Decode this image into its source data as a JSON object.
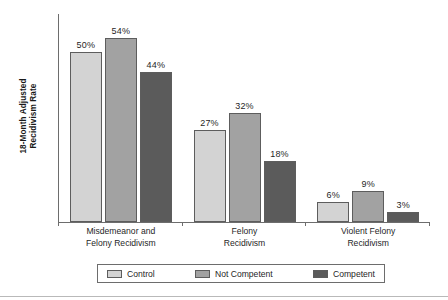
{
  "chart_data": {
    "type": "bar",
    "title": "",
    "subtitle": "",
    "xlabel": "",
    "ylabel": "18-Month Adjusted Recidivism Rate",
    "ylabel_lines": [
      "18-Month Adjusted",
      "Recidivism Rate"
    ],
    "ylim": [
      0,
      61
    ],
    "grid": false,
    "legend_position": "bottom",
    "value_suffix": "%",
    "categories": [
      "Misdemeanor and Felony Recidivism",
      "Felony Recidivism",
      "Violent Felony Recidivism"
    ],
    "category_lines": [
      [
        "Misdemeanor and",
        "Felony Recidivism"
      ],
      [
        "Felony",
        "Recidivism"
      ],
      [
        "Violent Felony",
        "Recidivism"
      ]
    ],
    "series": [
      {
        "name": "Control",
        "color": "#d3d3d3",
        "values": [
          50,
          27,
          6
        ],
        "labels": [
          "50%",
          "27%",
          "6%"
        ]
      },
      {
        "name": "Not Competent",
        "color": "#a2a2a2",
        "values": [
          54,
          32,
          9
        ],
        "labels": [
          "54%",
          "32%",
          "9%"
        ]
      },
      {
        "name": "Competent",
        "color": "#5b5b5b",
        "values": [
          44,
          18,
          3
        ],
        "labels": [
          "44%",
          "18%",
          "3%"
        ]
      }
    ]
  },
  "colors": {
    "control": "#d3d3d3",
    "not_competent": "#a2a2a2",
    "competent": "#5b5b5b",
    "axis": "#6d6d6d",
    "bar_outline": "#5d5d5d",
    "text": "#1f1f1f",
    "background": "#ffffff"
  }
}
